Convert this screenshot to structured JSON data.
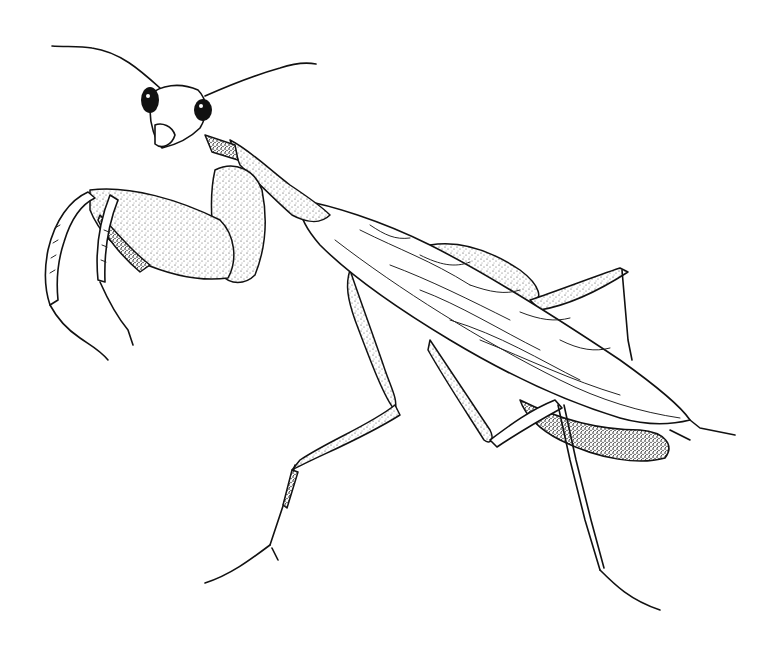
{
  "image": {
    "subject": "Praying mantis",
    "style": "black-and-white pen-and-ink stipple illustration",
    "background_color": "#ffffff",
    "ink_color": "#111111",
    "parts": [
      {
        "name": "antennae"
      },
      {
        "name": "head",
        "features": [
          "compound-eyes",
          "mouthparts"
        ]
      },
      {
        "name": "prothorax"
      },
      {
        "name": "raptorial-forelegs"
      },
      {
        "name": "wings",
        "features": [
          "venation"
        ]
      },
      {
        "name": "middle-legs"
      },
      {
        "name": "hind-legs"
      },
      {
        "name": "abdomen"
      },
      {
        "name": "cerci"
      }
    ]
  }
}
